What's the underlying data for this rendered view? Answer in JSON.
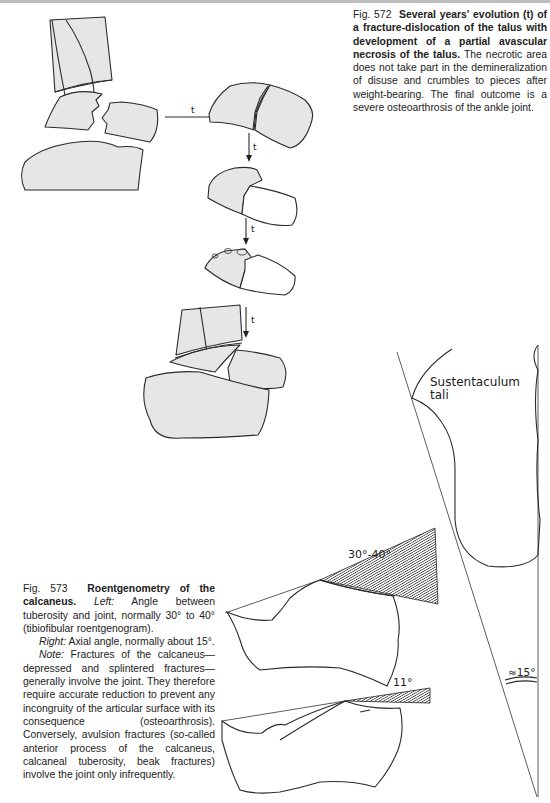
{
  "page": {
    "figures": [
      {
        "id": "fig-572",
        "number": "Fig. 572",
        "title": "Several years' evolution (t) of a fracture-dislocation of the talus with development of a partial avascular necrosis of the talus.",
        "body": "The necrotic area does not take part in the demineralization of disuse and crumbles to pieces after weight-bearing. The final outcome is a severe osteoarthrosis of the ankle joint.",
        "arrow_labels": [
          "t",
          "t",
          "t",
          "t"
        ]
      },
      {
        "id": "fig-573",
        "number": "Fig. 573",
        "title": "Roentgenometry of the calcaneus.",
        "left_label": "Left:",
        "left_text": "Angle between tuberosity and joint, normally 30° to 40° (tibiofibular roentgenogram).",
        "right_label": "Right:",
        "right_text": "Axial angle, normally about 15°.",
        "note_label": "Note:",
        "note_text": "Fractures of the calcaneus—depressed and splintered fractures—generally involve the joint. They therefore require accurate reduction to prevent any incongruity of the articular surface with its consequence (osteoarthrosis). Conversely, avulsion fractures (so-called anterior process of the calcaneus, calcaneal tuberosity, beak fractures) involve the joint only infrequently.",
        "diagram_labels": {
          "normal_angle": "30°-40°",
          "flattened_angle": "11°",
          "axial_angle": "≈15°",
          "sustentaculum_line1": "Sustentaculum",
          "sustentaculum_line2": "tali"
        }
      }
    ]
  }
}
